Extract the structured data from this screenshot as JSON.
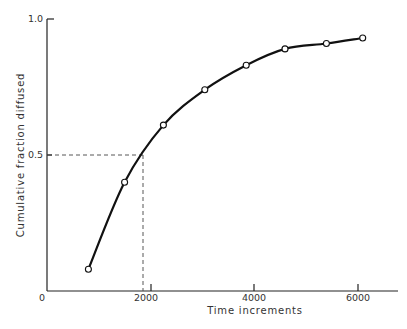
{
  "chart_data": {
    "type": "line",
    "title": "",
    "xlabel": "Time increments",
    "ylabel": "Cumulative fraction diffused",
    "xlim": [
      0,
      6700
    ],
    "ylim": [
      0,
      1.0
    ],
    "x_ticks": [
      0,
      2000,
      4000,
      6000
    ],
    "x_tick_labels": [
      "0",
      "2000",
      "4000",
      "6000"
    ],
    "y_ticks": [
      0.5,
      1.0
    ],
    "y_tick_labels": [
      "0.5",
      "1.0"
    ],
    "grid": false,
    "legend": null,
    "series": [
      {
        "name": "Cumulative fraction diffused",
        "style": "smooth curve with open circle markers",
        "x": [
          800,
          1500,
          2250,
          3050,
          3850,
          4600,
          5400,
          6100
        ],
        "y": [
          0.08,
          0.4,
          0.61,
          0.74,
          0.83,
          0.89,
          0.91,
          0.93
        ]
      }
    ],
    "annotations": [
      {
        "type": "dashed-guide",
        "description": "Horizontal dashed line from y-axis at 0.5 to curve, vertical dashed line down to x-axis",
        "y": 0.5,
        "x": 1800
      }
    ]
  }
}
